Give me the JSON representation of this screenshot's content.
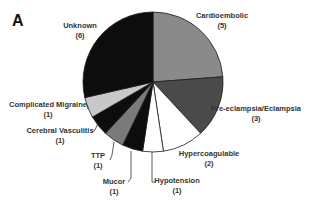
{
  "panel_label": "A",
  "chart_data": {
    "type": "pie",
    "title": "",
    "total": 22,
    "start_angle": "12 o'clock",
    "direction": "clockwise",
    "slices": [
      {
        "label": "Cardioembolic",
        "value": 5,
        "color": "#8a8a8a"
      },
      {
        "label": "Pre-eclampsia/Eclampsia",
        "value": 3,
        "color": "#4a4a4a"
      },
      {
        "label": "Hypercoagulable",
        "value": 2,
        "color": "#ffffff"
      },
      {
        "label": "Hypotension",
        "value": 1,
        "color": "#ffffff"
      },
      {
        "label": "Mucor",
        "value": 1,
        "color": "#0d0d0d"
      },
      {
        "label": "TTP",
        "value": 1,
        "color": "#7a7a7a"
      },
      {
        "label": "Cerebral Vasculitis",
        "value": 1,
        "color": "#0d0d0d"
      },
      {
        "label": "Complicated Migraine",
        "value": 1,
        "color": "#c8c8c8"
      },
      {
        "label": "Unknown",
        "value": 6,
        "color": "#0d0d0d"
      }
    ],
    "labels": [
      {
        "name": "Cardioembolic",
        "count": "(5)"
      },
      {
        "name": "Pre-eclampsia/Eclampsia",
        "count": "(3)"
      },
      {
        "name": "Hypercoagulable",
        "count": "(2)"
      },
      {
        "name": "Hypotension",
        "count": "(1)"
      },
      {
        "name": "Mucor",
        "count": "(1)"
      },
      {
        "name": "TTP",
        "count": "(1)"
      },
      {
        "name": "Cerebral Vasculitis",
        "count": "(1)"
      },
      {
        "name": "Complicated Migraine",
        "count": "(1)"
      },
      {
        "name": "Unknown",
        "count": "(6)"
      }
    ]
  }
}
